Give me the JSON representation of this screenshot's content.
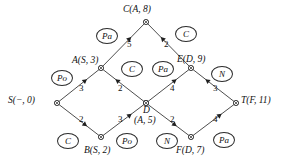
{
  "figure": {
    "type": "network-routing-diagram",
    "background_color": "#ffffff",
    "line_color": "#3a3a3a",
    "text_color": "#111111"
  },
  "nodes": [
    {
      "id": "S",
      "label": "S(−, 0)",
      "x": 57,
      "y": 103,
      "label_x": 8,
      "label_y": 96,
      "label_align": "right"
    },
    {
      "id": "A",
      "label": "A(S, 3)",
      "x": 101,
      "y": 68,
      "label_x": 72,
      "label_y": 56,
      "label_align": "left"
    },
    {
      "id": "B",
      "label": "B(S, 2)",
      "x": 101,
      "y": 137,
      "label_x": 84,
      "label_y": 146,
      "label_align": "left"
    },
    {
      "id": "C",
      "label": "C(A, 8)",
      "x": 146,
      "y": 22,
      "label_x": 123,
      "label_y": 5,
      "label_align": "left"
    },
    {
      "id": "D",
      "label": "D",
      "x": 146,
      "y": 103,
      "label_x": 143,
      "label_y": 106,
      "label_align": "left"
    },
    {
      "id": "D2",
      "label": "(A, 5)",
      "x": 146,
      "y": 103,
      "label_x": 134,
      "label_y": 116,
      "label_align": "left"
    },
    {
      "id": "E",
      "label": "E(D, 9)",
      "x": 191,
      "y": 68,
      "label_x": 177,
      "label_y": 55,
      "label_align": "left"
    },
    {
      "id": "F",
      "label": "F(D, 7)",
      "x": 191,
      "y": 137,
      "label_x": 176,
      "label_y": 146,
      "label_align": "left"
    },
    {
      "id": "T",
      "label": "T(F, 11)",
      "x": 236,
      "y": 103,
      "label_x": 241,
      "label_y": 96,
      "label_align": "left"
    }
  ],
  "edges": [
    {
      "from": "S",
      "to": "A",
      "weight": "3",
      "wx": 79,
      "wy": 83,
      "arrow_at": "A"
    },
    {
      "from": "S",
      "to": "B",
      "weight": "2",
      "wx": 79,
      "wy": 114,
      "arrow_at": "B"
    },
    {
      "from": "A",
      "to": "C",
      "weight": "5",
      "wx": 127,
      "wy": 39,
      "arrow_at": "C"
    },
    {
      "from": "C",
      "to": "E",
      "weight": "2",
      "wx": 164,
      "wy": 39,
      "arrow_at": "C"
    },
    {
      "from": "D",
      "to": "A",
      "weight": "2",
      "wx": 118,
      "wy": 83,
      "arrow_at": "A"
    },
    {
      "from": "B",
      "to": "D",
      "weight": "3",
      "wx": 118,
      "wy": 114,
      "arrow_at": "D"
    },
    {
      "from": "D",
      "to": "E",
      "weight": "4",
      "wx": 170,
      "wy": 83,
      "arrow_at": "E"
    },
    {
      "from": "D",
      "to": "F",
      "weight": "2",
      "wx": 170,
      "wy": 114,
      "arrow_at": "F"
    },
    {
      "from": "T",
      "to": "E",
      "weight": "3",
      "wx": 213,
      "wy": 83,
      "arrow_at": "E"
    },
    {
      "from": "F",
      "to": "T",
      "weight": "4",
      "wx": 213,
      "wy": 114,
      "arrow_at": "T"
    }
  ],
  "packets": [
    {
      "text": "Po",
      "x": 51,
      "y": 70
    },
    {
      "text": "Pa",
      "x": 96,
      "y": 28
    },
    {
      "text": "C",
      "x": 175,
      "y": 26
    },
    {
      "text": "C",
      "x": 121,
      "y": 61
    },
    {
      "text": "Pa",
      "x": 152,
      "y": 61
    },
    {
      "text": "N",
      "x": 211,
      "y": 66
    },
    {
      "text": "C",
      "x": 57,
      "y": 133
    },
    {
      "text": "Po",
      "x": 116,
      "y": 133
    },
    {
      "text": "N",
      "x": 156,
      "y": 133
    },
    {
      "text": "Pa",
      "x": 213,
      "y": 132
    }
  ]
}
